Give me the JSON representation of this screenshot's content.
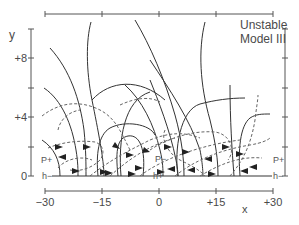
{
  "title": {
    "line1": "Unstable",
    "line2": "Model III"
  },
  "axes": {
    "x": {
      "label": "x",
      "ticks": [
        "−30",
        "−15",
        "0",
        "+15",
        "+30"
      ],
      "range": [
        -30,
        30
      ]
    },
    "y": {
      "label": "y",
      "ticks": [
        "0",
        "+4",
        "+8"
      ],
      "range": [
        0,
        10
      ]
    }
  },
  "annotations": {
    "p_plus_left": "P+",
    "p_minus_center": "P−",
    "p_plus_right": "P+",
    "h_minus_left": "h−",
    "h_plus_center": "h+",
    "h_minus_right": "h−"
  },
  "colors": {
    "solid_line": "#333333",
    "dashed_line": "#666666",
    "axis": "#555555",
    "baseline": "#999999"
  },
  "legend": {
    "solid": "field lines",
    "dashed": "trajectories"
  }
}
